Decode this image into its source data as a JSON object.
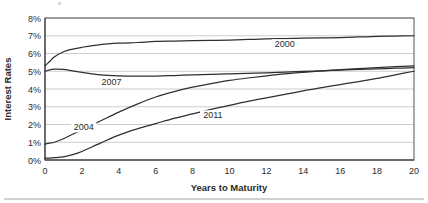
{
  "chart_data": {
    "type": "line",
    "title": "",
    "xlabel": "Years to Maturity",
    "ylabel": "Interest Rates",
    "xlim": [
      0,
      20
    ],
    "ylim": [
      0,
      8
    ],
    "grid": true,
    "legend_position": "inline-annotations",
    "x_tick_labels": [
      "0",
      "2",
      "4",
      "6",
      "8",
      "10",
      "12",
      "14",
      "16",
      "18",
      "20"
    ],
    "x_ticks": [
      0,
      2,
      4,
      6,
      8,
      10,
      12,
      14,
      16,
      18,
      20
    ],
    "y_tick_labels": [
      "0%",
      "1%",
      "2%",
      "3%",
      "4%",
      "5%",
      "6%",
      "7%",
      "8%"
    ],
    "y_ticks": [
      0,
      1,
      2,
      3,
      4,
      5,
      6,
      7,
      8
    ],
    "x": [
      0,
      0.25,
      0.5,
      1,
      1.5,
      2,
      3,
      4,
      5,
      6,
      7,
      8,
      9,
      10,
      11,
      12,
      13,
      14,
      15,
      16,
      17,
      18,
      19,
      20
    ],
    "series": [
      {
        "name": "2000",
        "label": "2000",
        "color": "#2f2f2f",
        "values": [
          5.3,
          5.55,
          5.8,
          6.1,
          6.25,
          6.35,
          6.5,
          6.58,
          6.62,
          6.68,
          6.7,
          6.72,
          6.74,
          6.76,
          6.79,
          6.82,
          6.84,
          6.86,
          6.88,
          6.9,
          6.93,
          6.96,
          6.98,
          7.0
        ]
      },
      {
        "name": "2007",
        "label": "2007",
        "color": "#2f2f2f",
        "values": [
          5.0,
          5.08,
          5.12,
          5.1,
          5.02,
          4.94,
          4.8,
          4.74,
          4.72,
          4.73,
          4.76,
          4.79,
          4.82,
          4.85,
          4.88,
          4.91,
          4.95,
          4.99,
          5.02,
          5.06,
          5.1,
          5.13,
          5.17,
          5.2
        ]
      },
      {
        "name": "2004",
        "label": "2004",
        "color": "#2f2f2f",
        "values": [
          0.9,
          0.95,
          1.0,
          1.2,
          1.45,
          1.7,
          2.2,
          2.7,
          3.15,
          3.55,
          3.85,
          4.1,
          4.3,
          4.48,
          4.62,
          4.74,
          4.85,
          4.94,
          5.02,
          5.09,
          5.15,
          5.21,
          5.26,
          5.3
        ]
      },
      {
        "name": "2011",
        "label": "2011",
        "color": "#2f2f2f",
        "values": [
          0.1,
          0.11,
          0.13,
          0.18,
          0.3,
          0.48,
          0.95,
          1.4,
          1.75,
          2.05,
          2.35,
          2.6,
          2.85,
          3.08,
          3.3,
          3.5,
          3.7,
          3.9,
          4.08,
          4.25,
          4.42,
          4.6,
          4.8,
          5.0
        ]
      }
    ],
    "annotations": [
      {
        "text": "2000",
        "x_value": 13.0,
        "y_value": 6.35
      },
      {
        "text": "2007",
        "x_value": 3.6,
        "y_value": 4.22
      },
      {
        "text": "2004",
        "x_value": 2.1,
        "y_value": 1.67
      },
      {
        "text": "2011",
        "x_value": 9.1,
        "y_value": 2.35
      }
    ]
  },
  "axis": {
    "y_title": "Interest Rates",
    "x_title": "Years to Maturity"
  }
}
